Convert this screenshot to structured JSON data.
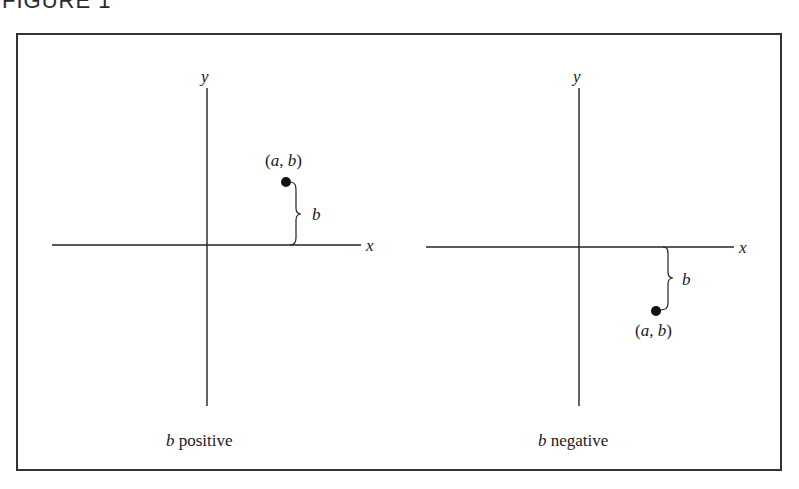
{
  "figure": {
    "title": "FIGURE 1",
    "frame": {
      "stroke": "#333333"
    },
    "panels": [
      {
        "id": "left",
        "caption_var": "b",
        "caption_text": " positive",
        "axis_x_label": "x",
        "axis_y_label": "y",
        "point_label": "(a, b)",
        "point_label_parts": [
          "(",
          "a",
          ", ",
          "b",
          ")"
        ],
        "brace_label": "b",
        "sign": "positive"
      },
      {
        "id": "right",
        "caption_var": "b",
        "caption_text": " negative",
        "axis_x_label": "x",
        "axis_y_label": "y",
        "point_label": "(a, b)",
        "point_label_parts": [
          "(",
          "a",
          ", ",
          "b",
          ")"
        ],
        "brace_label": "b",
        "sign": "negative"
      }
    ]
  }
}
